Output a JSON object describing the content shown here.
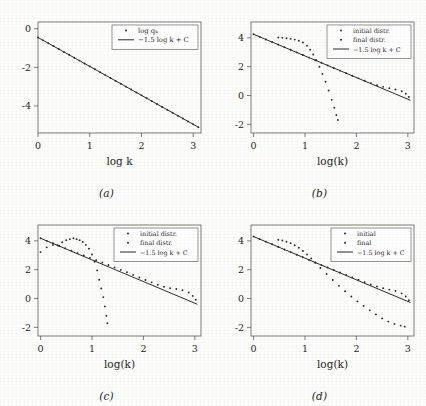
{
  "figure": {
    "background_color": "#fdfdfc",
    "ink_color": "#2b2b2b",
    "panel_count": 4
  },
  "panels": [
    {
      "caption": "(a)",
      "xlabel": "log k",
      "ylabel": "",
      "xticks": [
        "0",
        "1",
        "2",
        "3"
      ],
      "yticks": [
        "0",
        "-2",
        "-4"
      ],
      "legend": [
        {
          "label": "log qₖ",
          "marker": "dot"
        },
        {
          "label": "−1.5 log k + C",
          "marker": "line"
        }
      ]
    },
    {
      "caption": "(b)",
      "xlabel": "log(k)",
      "ylabel": "",
      "xticks": [
        "0",
        "1",
        "2",
        "3"
      ],
      "yticks": [
        "4",
        "2",
        "0",
        "-2"
      ],
      "legend": [
        {
          "label": "initial distr.",
          "marker": "dot"
        },
        {
          "label": "final distr.",
          "marker": "dot"
        },
        {
          "label": "−1.5 log k + C",
          "marker": "line"
        }
      ]
    },
    {
      "caption": "(c)",
      "xlabel": "log(k)",
      "ylabel": "",
      "xticks": [
        "0",
        "1",
        "2",
        "3"
      ],
      "yticks": [
        "4",
        "2",
        "0",
        "-2"
      ],
      "legend": [
        {
          "label": "initial distr.",
          "marker": "dot"
        },
        {
          "label": "final distr.",
          "marker": "dot"
        },
        {
          "label": "−1.5 log k + C",
          "marker": "line"
        }
      ]
    },
    {
      "caption": "(d)",
      "xlabel": "log(k)",
      "ylabel": "",
      "xticks": [
        "0",
        "1",
        "2",
        "3"
      ],
      "yticks": [
        "4",
        "2",
        "0",
        "-2"
      ],
      "legend": [
        {
          "label": "initial",
          "marker": "dot"
        },
        {
          "label": "final",
          "marker": "dot"
        },
        {
          "label": "−1.5 log k + C",
          "marker": "line"
        }
      ]
    }
  ],
  "chart_data": [
    {
      "type": "scatter",
      "panel": "(a)",
      "title": "",
      "xlabel": "log k",
      "ylabel": "",
      "xlim": [
        0,
        3.15
      ],
      "ylim": [
        -5.4,
        0.35
      ],
      "xticks": [
        0,
        1,
        2,
        3
      ],
      "yticks": [
        0,
        -2,
        -4
      ],
      "grid": false,
      "legend_position": "top-right",
      "series": [
        {
          "name": "log qₖ",
          "style": "dots",
          "x": [
            0.0,
            0.1,
            0.2,
            0.3,
            0.4,
            0.5,
            0.6,
            0.7,
            0.8,
            0.9,
            1.0,
            1.1,
            1.2,
            1.3,
            1.4,
            1.5,
            1.6,
            1.7,
            1.8,
            1.9,
            2.0,
            2.1,
            2.2,
            2.3,
            2.4,
            2.5,
            2.6,
            2.7,
            2.8,
            2.9,
            3.0,
            3.1
          ],
          "y": [
            -0.45,
            -0.6,
            -0.75,
            -0.9,
            -1.05,
            -1.2,
            -1.35,
            -1.5,
            -1.65,
            -1.8,
            -1.95,
            -2.1,
            -2.25,
            -2.4,
            -2.55,
            -2.7,
            -2.85,
            -3.0,
            -3.15,
            -3.3,
            -3.45,
            -3.6,
            -3.75,
            -3.9,
            -4.05,
            -4.2,
            -4.35,
            -4.5,
            -4.65,
            -4.8,
            -4.95,
            -5.1
          ]
        },
        {
          "name": "−1.5 log k + C",
          "style": "line",
          "slope": -1.5,
          "intercept": -0.45,
          "x": [
            0.0,
            3.1
          ],
          "y": [
            -0.45,
            -5.1
          ]
        }
      ]
    },
    {
      "type": "scatter",
      "panel": "(b)",
      "title": "",
      "xlabel": "log(k)",
      "ylabel": "",
      "xlim": [
        -0.05,
        3.12
      ],
      "ylim": [
        -2.6,
        5.1
      ],
      "xticks": [
        0,
        1,
        2,
        3
      ],
      "yticks": [
        4,
        2,
        0,
        -2
      ],
      "grid": false,
      "legend_position": "top-right",
      "series": [
        {
          "name": "initial distr.",
          "style": "dots",
          "x": [
            0.48,
            0.56,
            0.64,
            0.72,
            0.8,
            0.88,
            0.96,
            1.04,
            1.1,
            1.16,
            1.22,
            1.28,
            1.34,
            1.4,
            1.46,
            1.52,
            1.57,
            1.61,
            1.64
          ],
          "y": [
            4.02,
            4.0,
            3.97,
            3.93,
            3.88,
            3.8,
            3.68,
            3.45,
            3.18,
            2.85,
            2.45,
            2.0,
            1.5,
            0.95,
            0.35,
            -0.3,
            -0.85,
            -1.35,
            -1.7
          ]
        },
        {
          "name": "final distr.",
          "style": "dots",
          "x": [
            0.0,
            0.12,
            0.24,
            0.36,
            0.48,
            0.6,
            0.72,
            0.84,
            0.96,
            1.08,
            1.2,
            1.32,
            1.44,
            1.56,
            1.68,
            1.8,
            1.92,
            2.04,
            2.16,
            2.28,
            2.4,
            2.52,
            2.64,
            2.76,
            2.88,
            2.96,
            3.02
          ],
          "y": [
            4.25,
            4.07,
            3.89,
            3.71,
            3.53,
            3.35,
            3.17,
            2.99,
            2.81,
            2.63,
            2.45,
            2.27,
            2.09,
            1.91,
            1.73,
            1.55,
            1.37,
            1.19,
            1.02,
            0.86,
            0.72,
            0.6,
            0.5,
            0.42,
            0.3,
            0.12,
            -0.1
          ]
        },
        {
          "name": "−1.5 log k + C",
          "style": "line",
          "slope": -1.5,
          "intercept": 4.25,
          "x": [
            0.0,
            3.05
          ],
          "y": [
            4.25,
            -0.33
          ]
        }
      ]
    },
    {
      "type": "scatter",
      "panel": "(c)",
      "title": "",
      "xlabel": "log(k)",
      "ylabel": "",
      "xlim": [
        -0.05,
        3.12
      ],
      "ylim": [
        -2.6,
        5.1
      ],
      "xticks": [
        0,
        1,
        2,
        3
      ],
      "yticks": [
        4,
        2,
        0,
        -2
      ],
      "grid": false,
      "legend_position": "top-right",
      "series": [
        {
          "name": "initial distr.",
          "style": "dots",
          "x": [
            0.0,
            0.12,
            0.24,
            0.33,
            0.42,
            0.5,
            0.57,
            0.64,
            0.7,
            0.76,
            0.82,
            0.88,
            0.94,
            1.0,
            1.05,
            1.1,
            1.14,
            1.18,
            1.22,
            1.25,
            1.28,
            1.3
          ],
          "y": [
            3.22,
            3.55,
            3.72,
            3.7,
            3.9,
            4.05,
            4.12,
            4.18,
            4.12,
            4.05,
            3.92,
            3.72,
            3.45,
            3.05,
            2.55,
            1.95,
            1.3,
            0.7,
            0.1,
            -0.55,
            -1.2,
            -1.72
          ]
        },
        {
          "name": "final distr.",
          "style": "dots",
          "x": [
            0.0,
            0.12,
            0.24,
            0.36,
            0.48,
            0.6,
            0.72,
            0.84,
            0.96,
            1.08,
            1.2,
            1.32,
            1.44,
            1.56,
            1.68,
            1.8,
            1.92,
            2.04,
            2.16,
            2.28,
            2.4,
            2.52,
            2.64,
            2.76,
            2.88,
            2.96,
            3.02
          ],
          "y": [
            4.18,
            4.0,
            3.83,
            3.66,
            3.49,
            3.32,
            3.15,
            2.98,
            2.82,
            2.66,
            2.5,
            2.33,
            2.16,
            1.99,
            1.82,
            1.64,
            1.46,
            1.28,
            1.12,
            0.96,
            0.82,
            0.72,
            0.66,
            0.58,
            0.42,
            0.18,
            -0.08
          ]
        },
        {
          "name": "−1.5 log k + C",
          "style": "line",
          "slope": -1.5,
          "intercept": 4.18,
          "x": [
            0.0,
            3.05
          ],
          "y": [
            4.18,
            -0.4
          ]
        }
      ]
    },
    {
      "type": "scatter",
      "panel": "(d)",
      "title": "",
      "xlabel": "log(k)",
      "ylabel": "",
      "xlim": [
        -0.05,
        3.12
      ],
      "ylim": [
        -2.6,
        5.1
      ],
      "xticks": [
        0,
        1,
        2,
        3
      ],
      "yticks": [
        4,
        2,
        0,
        -2
      ],
      "grid": false,
      "legend_position": "top-right",
      "series": [
        {
          "name": "initial",
          "style": "dots",
          "x": [
            0.48,
            0.56,
            0.64,
            0.72,
            0.8,
            0.88,
            0.96,
            1.04,
            1.12,
            1.2,
            1.3,
            1.42,
            1.54,
            1.66,
            1.78,
            1.9,
            2.02,
            2.14,
            2.26,
            2.38,
            2.5,
            2.62,
            2.74,
            2.86,
            2.94
          ],
          "y": [
            4.08,
            4.02,
            3.94,
            3.84,
            3.7,
            3.52,
            3.3,
            3.05,
            2.78,
            2.48,
            2.12,
            1.7,
            1.28,
            0.88,
            0.5,
            0.14,
            -0.2,
            -0.52,
            -0.82,
            -1.1,
            -1.38,
            -1.6,
            -1.76,
            -1.88,
            -1.95
          ]
        },
        {
          "name": "final",
          "style": "dots",
          "x": [
            0.0,
            0.12,
            0.24,
            0.36,
            0.48,
            0.6,
            0.72,
            0.84,
            0.96,
            1.08,
            1.2,
            1.32,
            1.44,
            1.56,
            1.68,
            1.8,
            1.92,
            2.04,
            2.16,
            2.28,
            2.4,
            2.52,
            2.64,
            2.76,
            2.88,
            2.96,
            3.02
          ],
          "y": [
            4.3,
            4.12,
            3.94,
            3.76,
            3.58,
            3.4,
            3.22,
            3.04,
            2.86,
            2.68,
            2.5,
            2.32,
            2.15,
            1.98,
            1.81,
            1.64,
            1.47,
            1.3,
            1.14,
            0.98,
            0.84,
            0.72,
            0.62,
            0.52,
            0.36,
            0.14,
            -0.12
          ]
        },
        {
          "name": "−1.5 log k + C",
          "style": "line",
          "slope": -1.5,
          "intercept": 4.3,
          "x": [
            0.0,
            3.05
          ],
          "y": [
            4.3,
            -0.28
          ]
        }
      ]
    }
  ]
}
